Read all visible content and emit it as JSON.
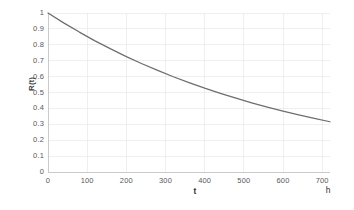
{
  "chart_data": {
    "type": "line",
    "title": "",
    "subtitle": "",
    "xlabel": "t",
    "ylabel": "R(t)",
    "x_unit_label": "h",
    "xlim": [
      0,
      720
    ],
    "ylim": [
      0,
      1
    ],
    "grid": true,
    "legend": null,
    "legend_position": "none",
    "series": [
      {
        "name": "R(t)",
        "color": "#6e6e6e",
        "x": [
          0,
          40,
          80,
          120,
          160,
          200,
          240,
          280,
          320,
          360,
          400,
          440,
          480,
          520,
          560,
          600,
          640,
          680,
          720
        ],
        "values": [
          1.0,
          0.938,
          0.88,
          0.825,
          0.774,
          0.726,
          0.681,
          0.639,
          0.599,
          0.562,
          0.527,
          0.495,
          0.464,
          0.435,
          0.408,
          0.383,
          0.359,
          0.337,
          0.316
        ]
      }
    ],
    "x_ticks": [
      0,
      100,
      200,
      300,
      400,
      500,
      600,
      700
    ],
    "x_tick_labels": [
      "0",
      "100",
      "200",
      "300",
      "400",
      "500",
      "600",
      "700"
    ],
    "y_ticks": [
      0,
      0.1,
      0.2,
      0.3,
      0.4,
      0.5,
      0.6,
      0.7,
      0.8,
      0.9,
      1
    ],
    "y_tick_labels": [
      "0",
      "0.1",
      "0.2",
      "0.3",
      "0.4",
      "0.5",
      "0.6",
      "0.7",
      "0.8",
      "0.9",
      "1"
    ],
    "colors": {
      "curve": "#6e6e6e",
      "gridline": "#e8e8e8",
      "axis": "#c4c4c4",
      "tick_text": "#595959",
      "title_text": "#2f2f2f",
      "background": "#ffffff"
    }
  }
}
